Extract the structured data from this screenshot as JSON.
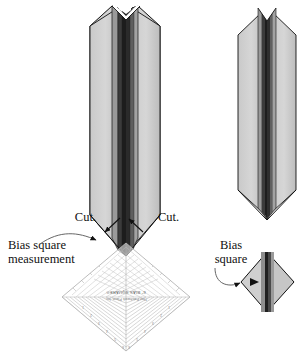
{
  "figure": {
    "background_color": "#ffffff"
  },
  "labels": {
    "cut_left": "Cut.",
    "cut_right": "Cut.",
    "bias_square_measurement_line1": "Bias square",
    "bias_square_measurement_line2": "measurement",
    "bias_square_line1": "Bias",
    "bias_square_line2": "square"
  },
  "ruler": {
    "brand_line1": "6\" BIAS SQUARE®",
    "brand_line2": "That Patchwork Place, Inc.",
    "orientation": "rotated-180",
    "tick_numbers": [
      "1",
      "2",
      "3",
      "4",
      "5",
      "6"
    ],
    "grid_line_count": 13
  },
  "colors": {
    "fabric_light": "#d2d2d2",
    "fabric_mid": "#b9b9b9",
    "fabric_dark": "#8d8d8d",
    "seam_dark": "#3a3a3a",
    "seam_darkest": "#1f1f1f",
    "outline": "#111111",
    "ruler_line": "#b0b0b0",
    "leader_line": "#555555",
    "arrow_fill": "#111111",
    "text": "#111111"
  },
  "shapes": {
    "left_strip_label": "long folded bias strip",
    "right_strip_label": "short folded bias strip",
    "small_diamond_label": "cut bias square unit"
  }
}
